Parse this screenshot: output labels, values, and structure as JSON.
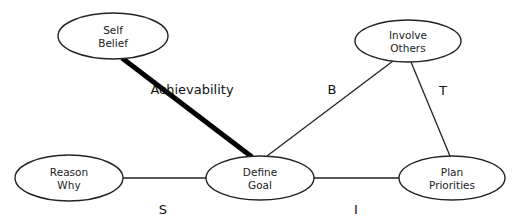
{
  "diagram": {
    "nodes": [
      {
        "id": "self-belief",
        "lines": [
          "Self",
          "Belief"
        ],
        "cx": 113,
        "cy": 36,
        "rx": 55,
        "ry": 23
      },
      {
        "id": "involve-others",
        "lines": [
          "Involve",
          "Others"
        ],
        "cx": 408,
        "cy": 41,
        "rx": 53,
        "ry": 21
      },
      {
        "id": "reason-why",
        "lines": [
          "Reason",
          "Why"
        ],
        "cx": 69,
        "cy": 178,
        "rx": 54,
        "ry": 23
      },
      {
        "id": "define-goal",
        "lines": [
          "Define",
          "Goal"
        ],
        "cx": 260,
        "cy": 178,
        "rx": 54,
        "ry": 22
      },
      {
        "id": "plan-priorities",
        "lines": [
          "Plan",
          "Priorities"
        ],
        "cx": 452,
        "cy": 178,
        "rx": 53,
        "ry": 22
      }
    ],
    "edges": [
      {
        "id": "self-belief-define-goal",
        "from": "self-belief",
        "to": "define-goal",
        "x1": 122,
        "y1": 58,
        "x2": 252,
        "y2": 157,
        "thick": true,
        "label": "Achievability",
        "lx": 192,
        "ly": 94
      },
      {
        "id": "define-goal-involve-others",
        "from": "define-goal",
        "to": "involve-others",
        "x1": 267,
        "y1": 156,
        "x2": 393,
        "y2": 61,
        "thick": false,
        "label": "B",
        "lx": 332,
        "ly": 94
      },
      {
        "id": "involve-others-plan-priorities",
        "from": "involve-others",
        "to": "plan-priorities",
        "x1": 411,
        "y1": 62,
        "x2": 450,
        "y2": 156,
        "thick": false,
        "label": "T",
        "lx": 443,
        "ly": 95
      },
      {
        "id": "reason-why-define-goal",
        "from": "reason-why",
        "to": "define-goal",
        "x1": 123,
        "y1": 178,
        "x2": 206,
        "y2": 178,
        "thick": false,
        "label": "S",
        "lx": 163,
        "ly": 214
      },
      {
        "id": "define-goal-plan-priorities",
        "from": "define-goal",
        "to": "plan-priorities",
        "x1": 314,
        "y1": 178,
        "x2": 399,
        "y2": 178,
        "thick": false,
        "label": "I",
        "lx": 356,
        "ly": 214
      }
    ]
  }
}
